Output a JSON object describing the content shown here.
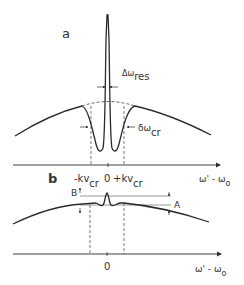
{
  "figure": {
    "panel_a": {
      "label": "a",
      "resonance_width_label": "Δω",
      "resonance_width_sub": "res",
      "cross_relax_width_label": "δω",
      "cross_relax_width_sub": "cr",
      "tick_left_main": "-kv",
      "tick_left_sub": "cr",
      "tick_center": "0",
      "tick_right_main": "+kv",
      "tick_right_sub": "cr",
      "axis_label_main": "ω' - ω",
      "axis_label_sub": "o"
    },
    "panel_b": {
      "label": "b",
      "marker_B": "B",
      "marker_A": "A",
      "tick_center": "0",
      "axis_label_main": "ω' - ω",
      "axis_label_sub": "o"
    },
    "colors": {
      "line": "#2a2a2a",
      "dashed": "#555555",
      "text": "#333333",
      "background": "#ffffff"
    }
  }
}
